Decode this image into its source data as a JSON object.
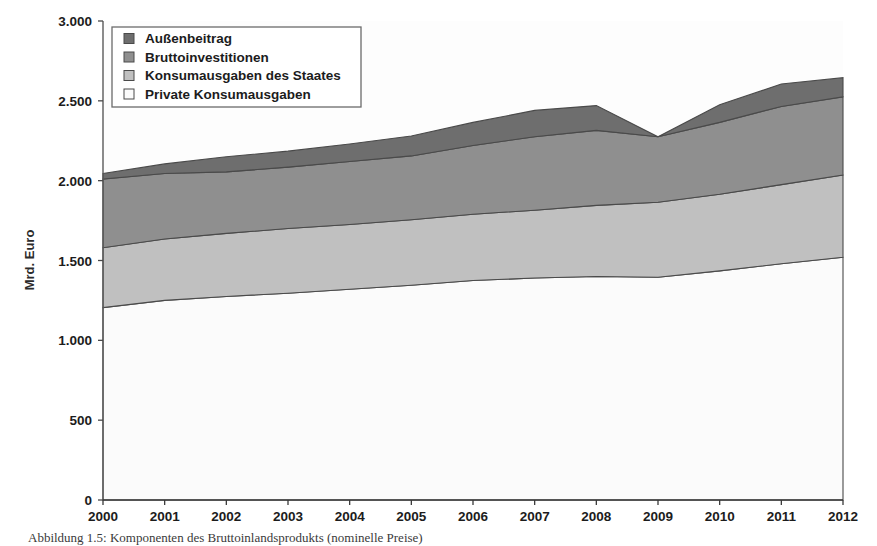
{
  "figure": {
    "caption": "Abbildung 1.5: Komponenten des Bruttoinlandsprodukts (nominelle Preise)",
    "background_color": "#ffffff",
    "plot_background_color": "#fdfdfd"
  },
  "legend": {
    "position": "top-left-inside",
    "border_color": "#666666",
    "items": [
      {
        "label": "Außenbeitrag",
        "color": "#6e6e6e"
      },
      {
        "label": "Bruttoinvestitionen",
        "color": "#8f8f8f"
      },
      {
        "label": "Konsumausgaben des Staates",
        "color": "#c0c0c0"
      },
      {
        "label": "Private Konsumausgaben",
        "color": "#fbfbfb"
      }
    ]
  },
  "chart_data": {
    "type": "area",
    "stacked": true,
    "title": "",
    "subtitle": "",
    "xlabel": "",
    "ylabel": "Mrd. Euro",
    "grid": false,
    "legend_position": "top-left",
    "categories": [
      "2000",
      "2001",
      "2002",
      "2003",
      "2004",
      "2005",
      "2006",
      "2007",
      "2008",
      "2009",
      "2010",
      "2011",
      "2012"
    ],
    "x": [
      2000,
      2001,
      2002,
      2003,
      2004,
      2005,
      2006,
      2007,
      2008,
      2009,
      2010,
      2011,
      2012
    ],
    "xlim": [
      2000,
      2012
    ],
    "ylim": [
      0,
      3000
    ],
    "ytick_values": [
      0,
      500,
      1000,
      1500,
      2000,
      2500,
      3000
    ],
    "ytick_labels": [
      "0",
      "500",
      "1.000",
      "1.500",
      "2.000",
      "2.500",
      "3.000"
    ],
    "xtick_labels": [
      "2000",
      "2001",
      "2002",
      "2003",
      "2004",
      "2005",
      "2006",
      "2007",
      "2008",
      "2009",
      "2010",
      "2011",
      "2012"
    ],
    "series": [
      {
        "name": "Private Konsumausgaben",
        "color": "#fbfbfb",
        "values": [
          1205,
          1250,
          1275,
          1295,
          1320,
          1345,
          1375,
          1390,
          1400,
          1395,
          1435,
          1480,
          1520
        ]
      },
      {
        "name": "Konsumausgaben des Staates",
        "color": "#c0c0c0",
        "values": [
          375,
          385,
          395,
          405,
          405,
          410,
          415,
          425,
          445,
          470,
          480,
          495,
          515
        ]
      },
      {
        "name": "Bruttoinvestitionen",
        "color": "#8f8f8f",
        "values": [
          430,
          410,
          385,
          385,
          395,
          400,
          430,
          460,
          470,
          410,
          450,
          490,
          490
        ]
      },
      {
        "name": "Außenbeitrag",
        "color": "#6e6e6e",
        "values": [
          35,
          60,
          95,
          100,
          110,
          125,
          145,
          165,
          155,
          0,
          110,
          140,
          120
        ]
      }
    ],
    "cumulative_totals": [
      2045,
      2105,
      2150,
      2185,
      2230,
      2280,
      2365,
      2440,
      2470,
      2275,
      2475,
      2605,
      2645
    ]
  }
}
